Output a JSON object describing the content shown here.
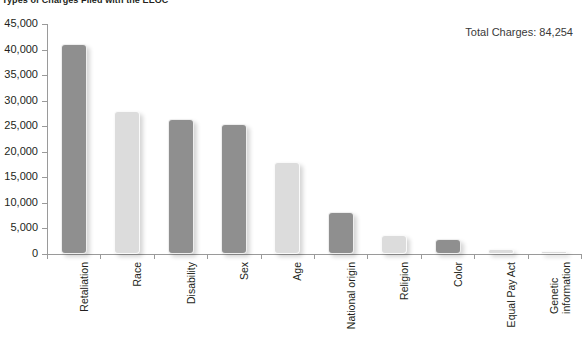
{
  "chart_title": "Types of Charges Filed with the EEOC",
  "annotation": {
    "total_label": "Total Charges: 84,254"
  },
  "axis": {
    "y_ticks": [
      "45,000",
      "40,000",
      "35,000",
      "30,000",
      "25,000",
      "20,000",
      "15,000",
      "10,000",
      "5,000",
      "0"
    ]
  },
  "chart_data": {
    "type": "bar",
    "title": "Types of Charges Filed with the EEOC",
    "xlabel": "",
    "ylabel": "",
    "ylim": [
      0,
      45000
    ],
    "ytick_step": 5000,
    "grid": false,
    "legend": "none",
    "annotations": [
      "Total Charges: 84,254"
    ],
    "categories": [
      "Retaliation",
      "Race",
      "Disability",
      "Sex",
      "Age",
      "National origin",
      "Religion",
      "Color",
      "Equal Pay Act",
      "Genetic information"
    ],
    "values": [
      41000,
      28000,
      26500,
      25500,
      18000,
      8300,
      3700,
      3000,
      1000,
      400
    ],
    "bar_colors": [
      "#8f8f8f",
      "#dcdcdc",
      "#8f8f8f",
      "#8f8f8f",
      "#dcdcdc",
      "#8f8f8f",
      "#dcdcdc",
      "#8f8f8f",
      "#dcdcdc",
      "#dcdcdc"
    ]
  },
  "colors": {
    "bar_dark": "#8f8f8f",
    "bar_light": "#dcdcdc",
    "axis": "#9a9a9a",
    "text": "#231f20",
    "background": "#ffffff"
  }
}
